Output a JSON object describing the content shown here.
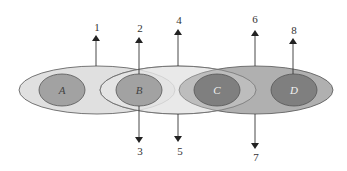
{
  "diagram": {
    "type": "overlapping-ellipses-with-arrows",
    "colors": {
      "ellipse_left": "#e0e0e0",
      "ellipse_middle": "#efefef",
      "ellipse_right": "#a9a9a9",
      "inner_light": "#a2a2a2",
      "inner_dark": "#7f7f7f",
      "stroke": "#555555",
      "arrow": "#222222"
    },
    "inner_labels": {
      "a": "A",
      "b": "B",
      "c": "C",
      "d": "D"
    },
    "arrows": {
      "a1": "1",
      "a2": "2",
      "a3": "3",
      "a4": "4",
      "a5": "5",
      "a6": "6",
      "a7": "7",
      "a8": "8"
    }
  }
}
